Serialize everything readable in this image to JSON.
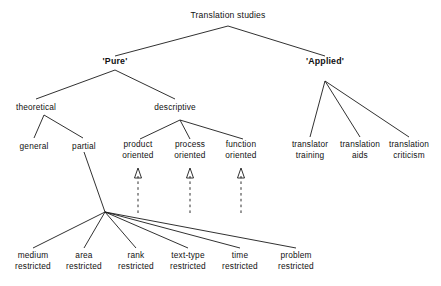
{
  "diagram": {
    "title": "Translation studies",
    "type": "tree-diagram",
    "line_color": "#1a1a1a",
    "background": "#ffffff",
    "nodes": {
      "root": {
        "label": "Translation studies"
      },
      "pure": {
        "label": "'Pure'"
      },
      "applied": {
        "label": "'Applied'"
      },
      "theoretical": {
        "label": "theoretical"
      },
      "descriptive": {
        "label": "descriptive"
      },
      "general": {
        "label": "general"
      },
      "partial": {
        "label": "partial"
      },
      "product_oriented": {
        "line1": "product",
        "line2": "oriented"
      },
      "process_oriented": {
        "line1": "process",
        "line2": "oriented"
      },
      "function_oriented": {
        "line1": "function",
        "line2": "oriented"
      },
      "translator_training": {
        "line1": "translator",
        "line2": "training"
      },
      "translation_aids": {
        "line1": "translation",
        "line2": "aids"
      },
      "translation_criticism": {
        "line1": "translation",
        "line2": "criticism"
      },
      "medium_restricted": {
        "line1": "medium",
        "line2": "restricted"
      },
      "area_restricted": {
        "line1": "area",
        "line2": "restricted"
      },
      "rank_restricted": {
        "line1": "rank",
        "line2": "restricted"
      },
      "texttype_restricted": {
        "line1": "text-type",
        "line2": "restricted"
      },
      "time_restricted": {
        "line1": "time",
        "line2": "restricted"
      },
      "problem_restricted": {
        "line1": "problem",
        "line2": "restricted"
      }
    }
  }
}
